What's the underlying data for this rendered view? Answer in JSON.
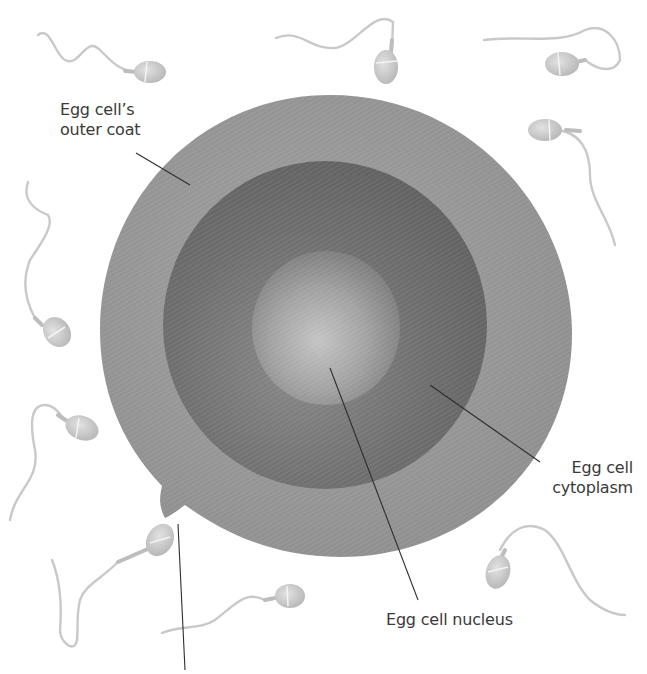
{
  "figure": {
    "colors": {
      "background": "#ffffff",
      "outer_coat": "#9a9a9a",
      "cytoplasm": "#6e6e6e",
      "nucleus": "#a8a8a8",
      "sperm": "#c8c8c8",
      "leader_line": "#2e2e2e",
      "label_text": "#3a3a3a"
    },
    "labels": {
      "outer_coat": {
        "line1": "Egg cell’s",
        "line2": "outer coat"
      },
      "cytoplasm": {
        "line1": "Egg cell",
        "line2": "cytoplasm"
      },
      "nucleus": {
        "line1": "Egg cell nucleus"
      }
    },
    "sperm_count": 10
  }
}
